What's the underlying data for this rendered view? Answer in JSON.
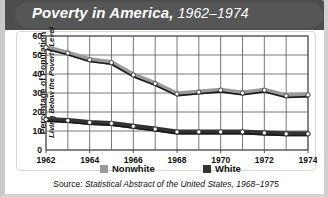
{
  "figure": {
    "title_main": "Poverty in America,",
    "title_years": "1962–1974",
    "source_prefix": "Source:",
    "source_citation": "Statistical Abstract of the United States, 1968–1975"
  },
  "colors": {
    "banner": "#565656",
    "nonwhite": "#9a9a9a",
    "white": "#333333",
    "grid": "#555555",
    "marker_fill": "#ffffff"
  },
  "legend": {
    "items": [
      {
        "label": "Nonwhite",
        "color": "#9a9a9a"
      },
      {
        "label": "White",
        "color": "#333333"
      }
    ]
  },
  "chart_data": {
    "type": "line",
    "title": "Poverty in America, 1962–1974",
    "xlabel": "",
    "ylabel": "Percentage of Population",
    "ylabel_sub": "Living Below the Poverty Level",
    "ylim": [
      0,
      60
    ],
    "yticks": [
      0,
      10,
      20,
      30,
      40,
      50,
      60
    ],
    "xlim": [
      1962,
      1974
    ],
    "x": [
      1962,
      1963,
      1964,
      1965,
      1966,
      1967,
      1968,
      1969,
      1970,
      1971,
      1972,
      1973,
      1974
    ],
    "xticks": [
      1962,
      1964,
      1966,
      1968,
      1970,
      1972,
      1974
    ],
    "xticklabels": [
      "1962",
      "1964",
      "1966",
      "1968",
      "1970",
      "1972",
      "1974"
    ],
    "grid": true,
    "legend_position": "bottom",
    "series": [
      {
        "name": "Nonwhite",
        "color": "#9a9a9a",
        "values": [
          54,
          51,
          47.5,
          46,
          39.5,
          35,
          29.5,
          30.5,
          31.5,
          30,
          31.5,
          28.5,
          29
        ]
      },
      {
        "name": "White",
        "color": "#333333",
        "values": [
          16,
          15.5,
          14.5,
          14,
          12.5,
          11,
          9.5,
          9.5,
          9.5,
          9.5,
          9,
          8.5,
          8.5
        ]
      }
    ]
  }
}
